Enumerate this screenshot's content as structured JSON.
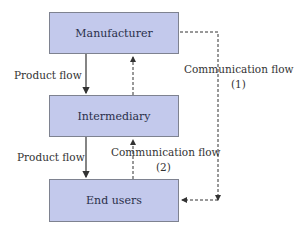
{
  "nodes": {
    "manufacturer": "Manufacturer",
    "intermediary": "Intermediary",
    "end_users": "End users"
  },
  "edges": {
    "product_flow_1": "Product flow",
    "product_flow_2": "Product flow",
    "communication_flow_1": "Communication flow",
    "communication_flow_1_num": "(1)",
    "communication_flow_2": "Communication flow",
    "communication_flow_2_num": "(2)"
  },
  "colors": {
    "box_fill": "#c3c9ec",
    "box_border": "#7e8290",
    "line": "#333333"
  }
}
